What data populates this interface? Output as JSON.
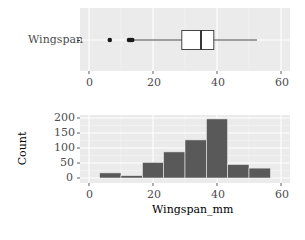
{
  "chart_data": [
    {
      "type": "boxplot",
      "title": "",
      "xlabel": "",
      "ylabel": "",
      "categories": [
        "Wingspan"
      ],
      "xlim": [
        -2,
        64
      ],
      "xticks": [
        0,
        20,
        40,
        60
      ],
      "box": {
        "whisker_low": 14,
        "q1": 29,
        "median": 35,
        "q3": 39,
        "whisker_high": 52.5
      },
      "outliers": [
        6.5,
        12.5,
        13,
        13.5
      ],
      "grid": true
    },
    {
      "type": "bar",
      "subtype": "histogram",
      "title": "",
      "xlabel": "Wingspan_mm",
      "ylabel": "Count",
      "xlim": [
        -2,
        64
      ],
      "ylim": [
        0,
        205
      ],
      "xticks": [
        0,
        20,
        40,
        60
      ],
      "yticks": [
        0,
        50,
        100,
        150,
        200
      ],
      "bin_width": 6.7,
      "bins": [
        {
          "start": 3.3,
          "end": 10.0,
          "count": 17
        },
        {
          "start": 10.0,
          "end": 16.7,
          "count": 8
        },
        {
          "start": 16.7,
          "end": 23.3,
          "count": 52
        },
        {
          "start": 23.3,
          "end": 30.0,
          "count": 87
        },
        {
          "start": 30.0,
          "end": 36.7,
          "count": 127
        },
        {
          "start": 36.7,
          "end": 43.3,
          "count": 197
        },
        {
          "start": 43.3,
          "end": 50.0,
          "count": 45
        },
        {
          "start": 50.0,
          "end": 56.7,
          "count": 33
        }
      ],
      "categories": [
        "3.3-10",
        "10-16.7",
        "16.7-23.3",
        "23.3-30",
        "30-36.7",
        "36.7-43.3",
        "43.3-50",
        "50-56.7"
      ],
      "values": [
        17,
        8,
        52,
        87,
        127,
        197,
        45,
        33
      ],
      "grid": true
    }
  ],
  "labels": {
    "box_category": "Wingspan",
    "x_ticks": [
      "0",
      "20",
      "40",
      "60"
    ],
    "y_ticks": [
      "200",
      "150",
      "100",
      "50",
      "0"
    ],
    "hist_xlabel": "Wingspan_mm",
    "hist_ylabel": "Count"
  },
  "colors": {
    "panel_bg": "#ebebeb",
    "bar_fill": "#595959",
    "box_fill": "#ffffff",
    "line": "#333333"
  }
}
